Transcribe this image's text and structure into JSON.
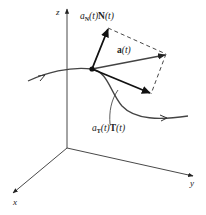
{
  "diagram": {
    "type": "3d-vector-decomposition",
    "axes": {
      "z_label": "z",
      "y_label": "y",
      "x_label": "x"
    },
    "vectors": {
      "normal_label": {
        "coef": "a",
        "coef_sub": "N",
        "arg1": "(t)",
        "vec": "N",
        "arg2": "(t)"
      },
      "acceleration_label": {
        "vec": "a",
        "arg": "(t)"
      },
      "tangential_label": {
        "coef": "a",
        "coef_sub": "T",
        "arg1": "(t)",
        "vec": "T",
        "arg2": "(t)"
      }
    },
    "colors": {
      "stroke": "#1a1a1a",
      "axis": "#333333",
      "curve": "#444444",
      "background": "#ffffff"
    }
  }
}
